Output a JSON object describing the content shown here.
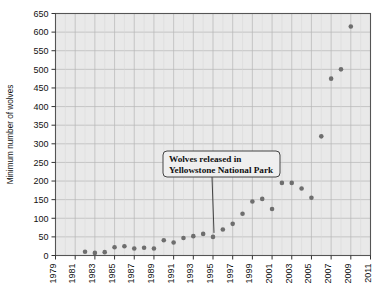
{
  "chart_data": {
    "type": "scatter",
    "title": "",
    "xlabel": "",
    "ylabel": "Minimum number of wolves",
    "xlim": [
      1979,
      2011
    ],
    "ylim": [
      0,
      650
    ],
    "ytick_step": 50,
    "xtick_step": 2,
    "grid": true,
    "legend": "none",
    "marker_color": "#6e6e6e",
    "plot_background": "#e9e9e9",
    "yticks": [
      0,
      50,
      100,
      150,
      200,
      250,
      300,
      350,
      400,
      450,
      500,
      550,
      600,
      650
    ],
    "xticks": [
      1979,
      1981,
      1983,
      1985,
      1987,
      1989,
      1991,
      1993,
      1995,
      1997,
      1999,
      2001,
      2003,
      2005,
      2007,
      2009,
      2011
    ],
    "x": [
      1982,
      1983,
      1984,
      1985,
      1986,
      1987,
      1988,
      1989,
      1990,
      1991,
      1992,
      1993,
      1994,
      1995,
      1996,
      1997,
      1998,
      1999,
      2000,
      2001,
      2002,
      2003,
      2004,
      2005,
      2006,
      2007,
      2008,
      2009
    ],
    "values": [
      10,
      7,
      9,
      22,
      25,
      19,
      21,
      19,
      41,
      35,
      47,
      52,
      58,
      50,
      70,
      85,
      112,
      145,
      152,
      125,
      195,
      195,
      180,
      155,
      320,
      475,
      500,
      615
    ],
    "annotations": [
      {
        "text_line1": "Wolves released in",
        "text_line2": "Yellowstone National Park",
        "points_to_x": 1995,
        "points_to_y": 50
      }
    ]
  },
  "axis": {
    "ylabel": "Minimum number of wolves"
  }
}
